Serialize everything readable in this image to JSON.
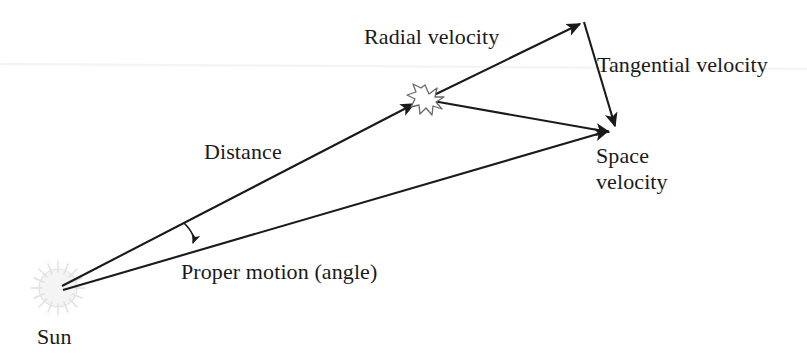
{
  "diagram": {
    "background_color": "#ffffff",
    "line_color": "#1a1a1a",
    "text_color": "#1a1a1a",
    "sun_glyph_color": "#c9c9c9",
    "star_glyph_color": "#4a4a4a",
    "labels": {
      "radial_velocity": "Radial velocity",
      "tangential_velocity": "Tangential velocity",
      "distance": "Distance",
      "space_velocity_line1": "Space",
      "space_velocity_line2": "velocity",
      "proper_motion": "Proper motion (angle)",
      "sun": "Sun"
    },
    "icons": {
      "sun": "sun-burst-icon",
      "star": "star-burst-icon"
    },
    "nodes": {
      "sun": {
        "x": 58,
        "y": 288
      },
      "star": {
        "x": 425,
        "y": 99
      },
      "radial_tip": {
        "x": 583,
        "y": 20
      },
      "space_velocity_tip": {
        "x": 617,
        "y": 133
      }
    },
    "vectors": [
      {
        "name": "distance",
        "from": "sun",
        "to": "star",
        "arrow": "end"
      },
      {
        "name": "radial-velocity",
        "from": "star",
        "to": "radial_tip",
        "arrow": "end"
      },
      {
        "name": "tangential-velocity",
        "from": "radial_tip",
        "to": "space_velocity_tip",
        "arrow": "end"
      },
      {
        "name": "space-velocity",
        "from": "star",
        "to": "space_velocity_tip",
        "arrow": "end"
      },
      {
        "name": "proper-motion-baseline",
        "from": "sun",
        "to": "space_velocity_tip",
        "arrow": "end"
      },
      {
        "name": "proper-motion-angle-arc",
        "from": "distance-line",
        "to": "baseline",
        "arrow": "end"
      }
    ]
  }
}
